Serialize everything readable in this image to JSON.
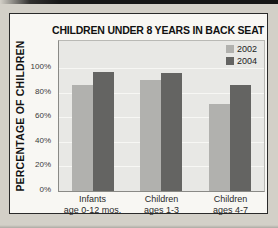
{
  "page": {
    "background": "#d3d0c8",
    "top_edge_color": "#161616",
    "chart_box_background": "#f8f7f3",
    "chart_box_border": "#2a2a2a"
  },
  "chart_data": {
    "type": "bar",
    "title": "CHILDREN UNDER 8 YEARS IN BACK SEAT",
    "xlabel": "",
    "ylabel": "PERCENTAGE OF CHILDREN",
    "categories": [
      "Infants age 0-12 mos.",
      "Children ages 1-3",
      "Children ages 4-7"
    ],
    "category_lines": [
      [
        "Infants",
        "age 0-12 mos."
      ],
      [
        "Children",
        "ages 1-3"
      ],
      [
        "Children",
        "ages 4-7"
      ]
    ],
    "series": [
      {
        "name": "2002",
        "color": "#b1b1ae",
        "values": [
          86,
          90,
          71
        ]
      },
      {
        "name": "2004",
        "color": "#646462",
        "values": [
          97,
          96,
          86
        ]
      }
    ],
    "ylim": [
      0,
      122
    ],
    "yticks": [
      0,
      20,
      40,
      60,
      80,
      100
    ],
    "ytick_labels": [
      "0%",
      "20%",
      "40%",
      "60%",
      "80%",
      "100%"
    ],
    "grid": true,
    "gridline_color": "#f7f7f4",
    "plot_background": "#e8e8e5",
    "legend_position": "top-right-inside"
  }
}
